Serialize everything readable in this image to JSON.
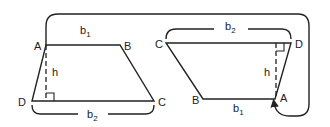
{
  "diagram": {
    "left_trapezoid": {
      "vertices": {
        "A": "A",
        "B": "B",
        "C": "C",
        "D": "D"
      },
      "top_base": {
        "letter": "b",
        "subscript": "1"
      },
      "bottom_base": {
        "letter": "b",
        "subscript": "2"
      },
      "height": "h"
    },
    "right_trapezoid": {
      "vertices": {
        "A": "A",
        "B": "B",
        "C": "C",
        "D": "D"
      },
      "top_base": {
        "letter": "b",
        "subscript": "2"
      },
      "bottom_base": {
        "letter": "b",
        "subscript": "1"
      },
      "height": "h"
    },
    "connector": "curved-arrow-from-left-A-to-right-A",
    "color": "#222222"
  }
}
